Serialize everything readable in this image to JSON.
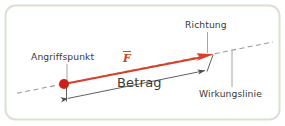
{
  "figure": {
    "card": {
      "border_color": "#d7e2d4",
      "background_color": "#ffffff",
      "corner_radius": 10
    },
    "colors": {
      "vector_red": "#d8402a",
      "point_red": "#cc2018",
      "dashed_line": "#9a9a9a",
      "dimension_line": "#5a5a5a",
      "leader_line": "#9a9a9a",
      "text": "#3a3a3a",
      "card_border": "#d7e2d4"
    },
    "labels": {
      "angriffspunkt": "Angriffspunkt",
      "richtung": "Richtung",
      "wirkungslinie": "Wirkungslinie",
      "betrag": "Betrag",
      "vector_symbol": "F"
    },
    "elements": {
      "action_point": {
        "name": "Angriffspunkt",
        "x": 64,
        "y": 84
      },
      "vector_arrow": {
        "name": "Kraftvektor F",
        "x1": 64,
        "y1": 84,
        "x2": 212,
        "y2": 55
      },
      "line_of_action": {
        "name": "Wirkungslinie",
        "x1": 17,
        "y1": 93,
        "x2": 273,
        "y2": 42,
        "style": "dashed"
      },
      "magnitude_dimension": {
        "name": "Betrag",
        "x1": 66,
        "y1": 98,
        "x2": 206,
        "y2": 70,
        "arrows": "both"
      }
    }
  }
}
